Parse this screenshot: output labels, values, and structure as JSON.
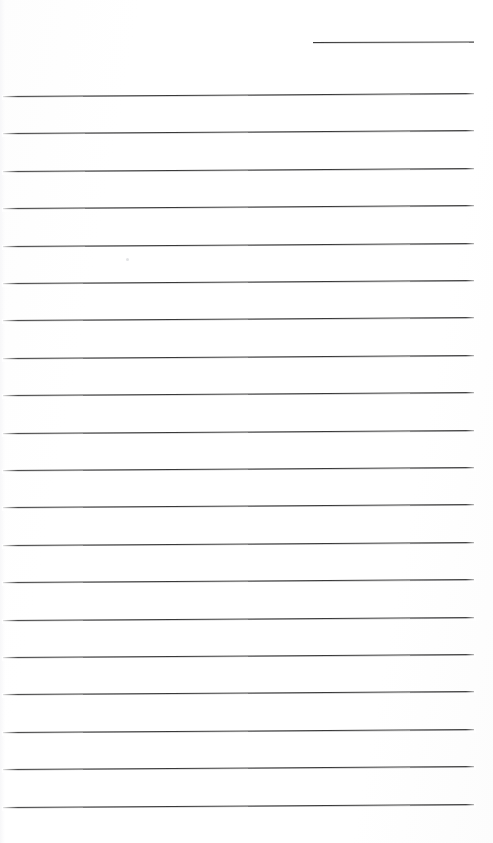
{
  "page": {
    "width": 493,
    "height": 843,
    "background_color": "#ffffff",
    "paper_color": "#fefefe"
  },
  "ink": {
    "rule_color": "#3a3a3a",
    "rule_thickness_px": 1.4,
    "shadow_color": "#5a5a5f"
  },
  "header_rule": {
    "name": "header-blank-line",
    "x_start": 313,
    "x_end": 474,
    "y": 42,
    "length": 161,
    "tilt_deg": -0.18
  },
  "body_rules": {
    "count": 20,
    "x_start": 3,
    "x_end": 474,
    "length": 471,
    "first_y": 96,
    "spacing": 37.4,
    "tilt_deg": -0.35,
    "y_positions": [
      96,
      133.4,
      170.8,
      208.2,
      245.6,
      283,
      320.4,
      357.8,
      395.2,
      432.6,
      470,
      507.4,
      544.8,
      582.2,
      619.6,
      657,
      694.4,
      731.8,
      769.2,
      806.6
    ]
  },
  "artifacts": {
    "speck": {
      "x": 126,
      "y": 258
    }
  },
  "content": {
    "written_text": "",
    "note": "No handwriting or printed text present; page is blank."
  }
}
